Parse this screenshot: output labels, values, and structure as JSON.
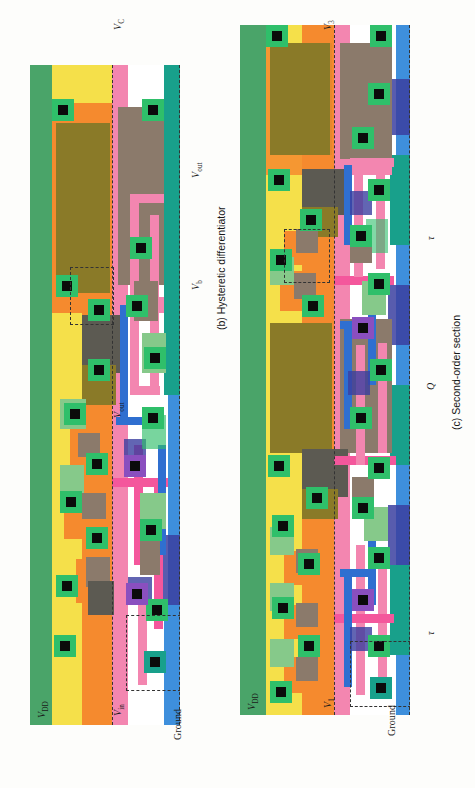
{
  "figure": {
    "orientation": "rotated-90-ccw",
    "background": "#fdfdfb",
    "panels": [
      {
        "id": "a",
        "caption": "(a) Follower–integrator",
        "top_label": "Vout",
        "left_labels": [
          "VDD",
          "Vin",
          "Ground"
        ],
        "right_labels": [
          "Vb"
        ]
      },
      {
        "id": "b",
        "caption": "(b) Hysteretic differentiator",
        "top_label": "VC",
        "left_labels": [
          "VDD",
          "Vin",
          "Ground"
        ],
        "right_labels": [
          "Vout",
          "Vb"
        ]
      },
      {
        "id": "c",
        "caption": "(c) Second-order section",
        "top_label": "V3",
        "left_labels": [
          "VDD",
          "V1",
          "Ground"
        ],
        "right_labels": [
          "τ",
          "Q",
          "τ"
        ]
      }
    ]
  },
  "labels": {
    "vdd": {
      "base": "V",
      "sub": "DD"
    },
    "vin": {
      "base": "V",
      "sub": "in"
    },
    "vout": {
      "base": "V",
      "sub": "out"
    },
    "vb": {
      "base": "V",
      "sub": "b"
    },
    "vc": {
      "base": "V",
      "sub": "C"
    },
    "v1": {
      "base": "V",
      "sub": "1"
    },
    "v3": {
      "base": "V",
      "sub": "3"
    },
    "ground": {
      "base": "Ground",
      "sub": ""
    },
    "tau": {
      "base": "τ",
      "sub": ""
    },
    "q": {
      "base": "Q",
      "sub": ""
    }
  },
  "captions": {
    "a": "(a) Follower–integrator",
    "b": "(b) Hysteretic differentiator",
    "c": "(c) Second-order section"
  },
  "palette": {
    "green_rail": "#4aa469",
    "yellow": "#f5e04a",
    "orange": "#f58a2e",
    "pink": "#f386b0",
    "hot_pink": "#f4579c",
    "blue": "#3e8fdc",
    "mid_blue": "#2f6fd0",
    "dark_blue": "#3b3fa0",
    "teal": "#18a08b",
    "olive": "#8a7a28",
    "brown": "#8b7a6b",
    "grey_brown": "#5c5a52",
    "light_green": "#86c98a",
    "bright_green": "#2fbf6a",
    "white": "#ffffff",
    "contact": "#0b0b0b"
  },
  "layout_note": "CMOS analog VLSI chip micrographs / mask layouts, three sub-circuits"
}
